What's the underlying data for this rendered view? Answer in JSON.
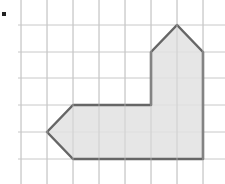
{
  "diagram": {
    "type": "grid-polygon",
    "bullet": "■",
    "grid": {
      "x_lines": [
        21,
        47,
        73,
        99,
        125,
        151,
        177,
        203
      ],
      "y_lines": [
        25,
        52,
        78,
        105,
        132,
        159
      ],
      "line_color": "#c8c8c8",
      "cell_size": 26
    },
    "shape": {
      "points": "177,25 203,52 203,159 73,159 47,132 73,105 151,105 151,52",
      "fill": "#e2e2e2",
      "stroke": "#666666"
    }
  }
}
